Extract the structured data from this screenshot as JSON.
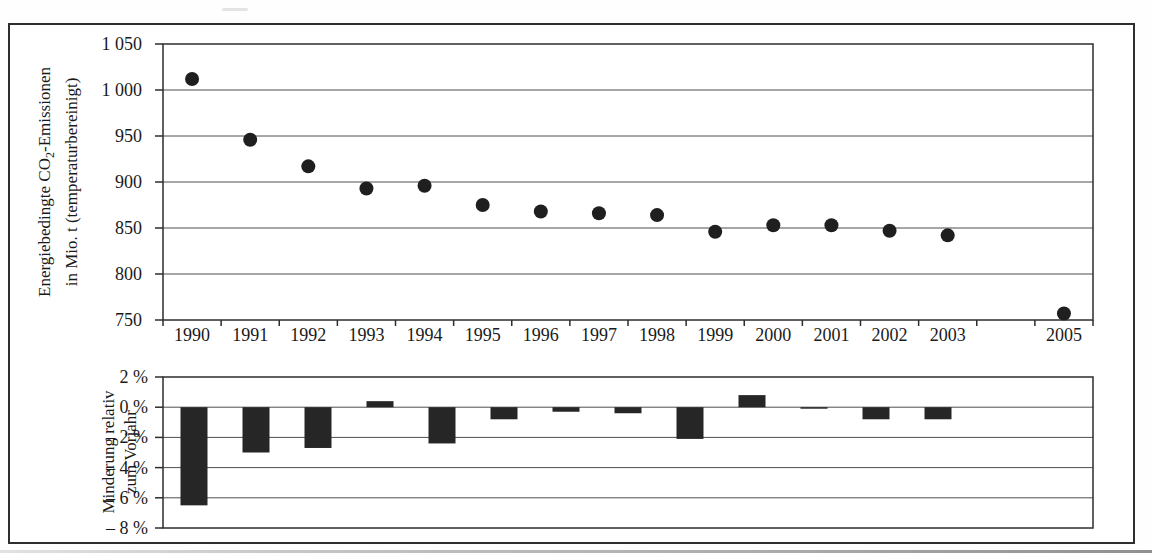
{
  "figure": {
    "border_color": "#2e2e2e",
    "ink_color": "#2d2d2d",
    "grid_color": "#4f4f4f",
    "text_color": "#1a1a1a",
    "marker_color": "#1f1f1f",
    "bar_color": "#262626"
  },
  "axis_titles": {
    "top": {
      "line1_pre": "Energiebedingte CO",
      "line1_sub": "2",
      "line1_post": "-Emissionen",
      "line2": "in Mio. t (temperaturbereinigt)"
    },
    "bottom": {
      "line1": "Minderung relativ",
      "line2": "zum Vorjahr"
    }
  },
  "chart_data": [
    {
      "type": "scatter",
      "title": "",
      "ylabel": "Energiebedingte CO2-Emissionen in Mio. t (temperaturbereinigt)",
      "xlabel": "",
      "categories": [
        "1990",
        "1991",
        "1992",
        "1993",
        "1994",
        "1995",
        "1996",
        "1997",
        "1998",
        "1999",
        "2000",
        "2001",
        "2002",
        "2003",
        "",
        "2005"
      ],
      "values": [
        1012,
        946,
        917,
        893,
        896,
        875,
        868,
        866,
        864,
        846,
        853,
        853,
        847,
        842,
        null,
        757
      ],
      "ylim": [
        750,
        1050
      ],
      "yticks": [
        1050,
        1000,
        950,
        900,
        850,
        800,
        750
      ],
      "ytick_labels": [
        "1 050",
        "1 000",
        "950",
        "900",
        "850",
        "800",
        "750"
      ],
      "grid": true,
      "legend": "none",
      "note": "no data point for 2004"
    },
    {
      "type": "bar",
      "title": "",
      "ylabel": "Minderung relativ zum Vorjahr",
      "xlabel": "",
      "categories": [
        "1991",
        "1992",
        "1993",
        "1994",
        "1995",
        "1996",
        "1997",
        "1998",
        "1999",
        "2000",
        "2001",
        "2002",
        "2003",
        "2004",
        "2005"
      ],
      "values": [
        -6.5,
        -3.0,
        -2.7,
        0.4,
        -2.4,
        -0.8,
        -0.3,
        -0.4,
        -2.1,
        0.8,
        -0.1,
        -0.8,
        -0.8,
        null,
        null
      ],
      "ylim": [
        -8,
        2
      ],
      "yticks": [
        2,
        0,
        -2,
        -4,
        -6,
        -8
      ],
      "ytick_labels": [
        "2 %",
        "0 %",
        "– 2 %",
        "– 4 %",
        "– 6 %",
        "– 8 %"
      ],
      "grid": true,
      "legend": "none",
      "x_labels_shown": false
    }
  ]
}
